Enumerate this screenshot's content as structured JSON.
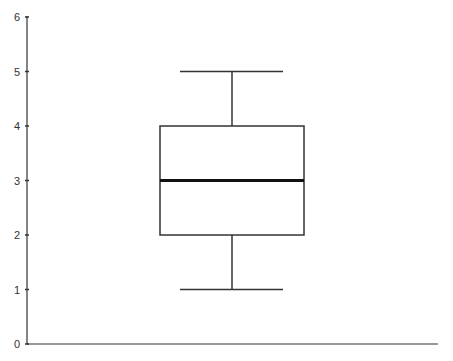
{
  "chart_data": {
    "type": "boxplot",
    "title": "",
    "xlabel": "",
    "ylabel": "",
    "ylim": [
      0,
      6
    ],
    "yticks": [
      "0",
      "1",
      "2",
      "3",
      "4",
      "5",
      "6"
    ],
    "grid": false,
    "legend": null,
    "series": [
      {
        "name": "",
        "min": 1,
        "q1": 2,
        "median": 3,
        "q3": 4,
        "max": 5
      }
    ]
  },
  "colors": {
    "line": "#333333",
    "median": "#111111",
    "background": "#ffffff"
  }
}
